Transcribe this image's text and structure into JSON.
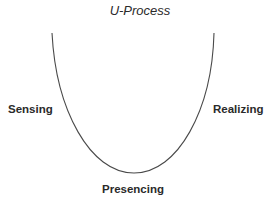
{
  "diagram": {
    "title": "U-Process",
    "labels": {
      "left": "Sensing",
      "right": "Realizing",
      "bottom": "Presencing"
    },
    "curve": {
      "shape": "U",
      "stroke_color": "#4a4a4a",
      "left_top": [
        52,
        33
      ],
      "right_top": [
        214,
        33
      ],
      "bottom": [
        134,
        173
      ]
    }
  }
}
